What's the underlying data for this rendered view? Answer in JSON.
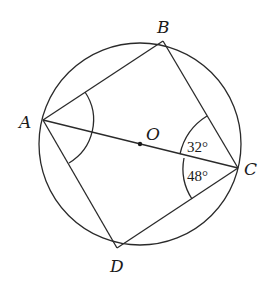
{
  "diagram": {
    "type": "circle-inscribed-quadrilateral",
    "circle": {
      "center_label": "O",
      "cx": 140,
      "cy": 144,
      "r": 101
    },
    "points": {
      "A": {
        "label": "A",
        "x": 43,
        "y": 120
      },
      "B": {
        "label": "B",
        "x": 163,
        "y": 41
      },
      "C": {
        "label": "C",
        "x": 238,
        "y": 168
      },
      "D": {
        "label": "D",
        "x": 117,
        "y": 248
      },
      "O": {
        "label": "O",
        "x": 140,
        "y": 144
      }
    },
    "segments": [
      "AB",
      "BC",
      "CD",
      "DA",
      "AC"
    ],
    "angles": [
      {
        "vertex": "A",
        "between": [
          "AB",
          "AD"
        ],
        "label": ""
      },
      {
        "vertex": "C",
        "between": [
          "CB",
          "CA"
        ],
        "label": "32°",
        "value": 32
      },
      {
        "vertex": "C",
        "between": [
          "CA",
          "CD"
        ],
        "label": "48°",
        "value": 48
      }
    ],
    "colors": {
      "stroke": "#2a2a2a",
      "text": "#1a1a1a",
      "background": "#ffffff"
    }
  }
}
